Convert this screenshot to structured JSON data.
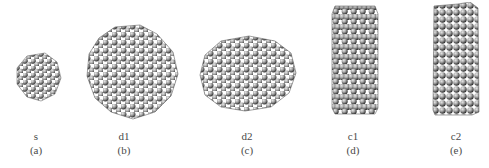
{
  "figure": {
    "panels": [
      {
        "id": "a",
        "name": "s",
        "letter": "(a)",
        "shape": "small-sphere"
      },
      {
        "id": "b",
        "name": "d1",
        "letter": "(b)",
        "shape": "large-sphere"
      },
      {
        "id": "c",
        "name": "d2",
        "letter": "(c)",
        "shape": "flattened-disk"
      },
      {
        "id": "d",
        "name": "c1",
        "letter": "(d)",
        "shape": "hexagonal-cylinder"
      },
      {
        "id": "e",
        "name": "c2",
        "letter": "(e)",
        "shape": "square-cylinder"
      }
    ],
    "colors": {
      "atom_light": "#d8d8d8",
      "atom_mid": "#9a9a9a",
      "atom_dark": "#3a3a3a",
      "background": "#ffffff"
    }
  }
}
